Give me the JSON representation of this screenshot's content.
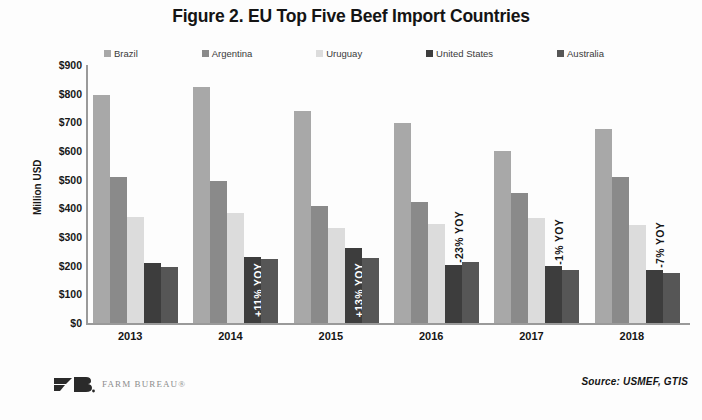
{
  "chart_data": {
    "type": "bar",
    "title": "Figure 2. EU Top Five Beef Import Countries",
    "xlabel": "",
    "ylabel": "Million USD",
    "ylim": [
      0,
      900
    ],
    "ytick_step": 100,
    "grid": false,
    "legend_position": "top",
    "categories": [
      "2013",
      "2014",
      "2015",
      "2016",
      "2017",
      "2018"
    ],
    "series": [
      {
        "name": "Brazil",
        "color": "#a8a8a8",
        "values": [
          795,
          825,
          740,
          698,
          600,
          678
        ]
      },
      {
        "name": "Argentina",
        "color": "#8a8a8a",
        "values": [
          510,
          497,
          408,
          423,
          455,
          510
        ]
      },
      {
        "name": "Uruguay",
        "color": "#dcdcdc",
        "values": [
          370,
          383,
          333,
          345,
          365,
          343
        ]
      },
      {
        "name": "United States",
        "color": "#3d3d3d",
        "values": [
          210,
          232,
          262,
          202,
          198,
          185
        ]
      },
      {
        "name": "Australia",
        "color": "#565656",
        "values": [
          197,
          222,
          228,
          212,
          185,
          173
        ]
      }
    ],
    "annotations": [
      {
        "category": "2014",
        "series": "United States",
        "text": "+11% YOY",
        "placement": "inside"
      },
      {
        "category": "2015",
        "series": "United States",
        "text": "+13% YOY",
        "placement": "inside"
      },
      {
        "category": "2016",
        "series": "United States",
        "text": "-23% YOY",
        "placement": "outside"
      },
      {
        "category": "2017",
        "series": "United States",
        "text": "-1% YOY",
        "placement": "outside"
      },
      {
        "category": "2018",
        "series": "United States",
        "text": "-7% YOY",
        "placement": "outside"
      }
    ],
    "ytick_labels": [
      "$900",
      "$800",
      "$700",
      "$600",
      "$500",
      "$400",
      "$300",
      "$200",
      "$100",
      "$0"
    ],
    "ytick_values": [
      900,
      800,
      700,
      600,
      500,
      400,
      300,
      200,
      100,
      0
    ]
  },
  "footer": {
    "logo_text": "FARM BUREAU®",
    "source": "Source: USMEF, GTIS"
  },
  "colors": {
    "axis": "#9a9a9a",
    "text": "#161616",
    "annotation_light": "#ffffff",
    "annotation_dark": "#161616"
  }
}
